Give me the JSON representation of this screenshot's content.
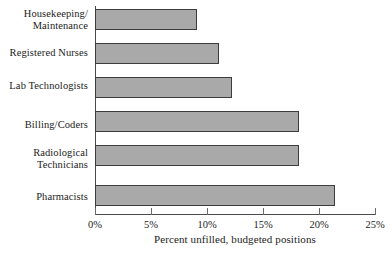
{
  "chart_data": {
    "type": "bar",
    "orientation": "horizontal",
    "title": "",
    "xlabel": "Percent unfilled, budgeted positions",
    "ylabel": "",
    "xlim": [
      0,
      25
    ],
    "xticks": [
      0,
      5,
      10,
      15,
      20,
      25
    ],
    "xtick_labels": [
      "0%",
      "5%",
      "10%",
      "15%",
      "20%",
      "25%"
    ],
    "grid": false,
    "legend": null,
    "bar_color": "#a9a9a9",
    "bar_edge_color": "#3c3c3c",
    "axis_color": "#4a4a4a",
    "categories": [
      "Housekeeping/\nMaintenance",
      "Registered Nurses",
      "Lab Technologists",
      "Billing/Coders",
      "Radiological\nTechnicians",
      "Pharmacists"
    ],
    "values": [
      9.1,
      11.1,
      12.2,
      18.2,
      18.2,
      21.4
    ]
  }
}
